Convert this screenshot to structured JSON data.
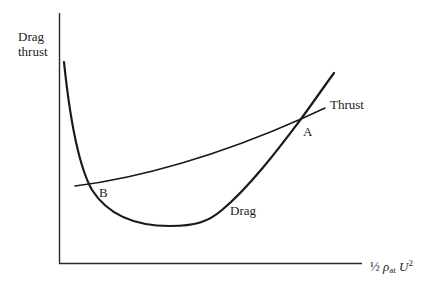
{
  "diagram": {
    "y_axis_label": [
      "Drag",
      "thrust"
    ],
    "x_axis_label": {
      "fraction": "½",
      "rho": "ρ",
      "rho_sub": "at",
      "u": "U",
      "u_sup": "2"
    },
    "curves": [
      {
        "name": "Drag",
        "label": "Drag",
        "shape": "U-shaped curve, steep descent from upper left, minimum near middle, rising steeply to upper right"
      },
      {
        "name": "Thrust",
        "label": "Thrust",
        "shape": "nearly straight line rising gently left to right"
      }
    ],
    "points": [
      {
        "label": "A",
        "description": "high-speed intersection of thrust and drag"
      },
      {
        "label": "B",
        "description": "low-speed intersection of thrust and drag"
      }
    ],
    "colors": {
      "line": "#1a1a1a",
      "background": "#ffffff"
    }
  }
}
